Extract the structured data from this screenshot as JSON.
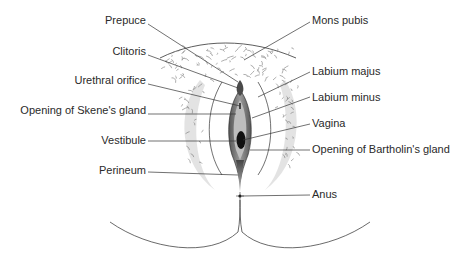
{
  "diagram": {
    "labels_left": [
      {
        "id": "prepuce",
        "text": "Prepuce"
      },
      {
        "id": "clitoris",
        "text": "Clitoris"
      },
      {
        "id": "urethral-orifice",
        "text": "Urethral orifice"
      },
      {
        "id": "skene-gland",
        "text": "Opening of Skene's gland"
      },
      {
        "id": "vestibule",
        "text": "Vestibule"
      },
      {
        "id": "perineum",
        "text": "Perineum"
      }
    ],
    "labels_right": [
      {
        "id": "mons-pubis",
        "text": "Mons pubis"
      },
      {
        "id": "labium-majus",
        "text": "Labium majus"
      },
      {
        "id": "labium-minus",
        "text": "Labium minus"
      },
      {
        "id": "vagina",
        "text": "Vagina"
      },
      {
        "id": "bartholin-gland",
        "text": "Opening of Bartholin's gland"
      },
      {
        "id": "anus",
        "text": "Anus"
      }
    ],
    "colors": {
      "line": "#333333",
      "text": "#2a2a2a",
      "shade_light": "#d8d8d8",
      "shade_dark": "#3a3a3a",
      "hair": "#777777"
    }
  }
}
